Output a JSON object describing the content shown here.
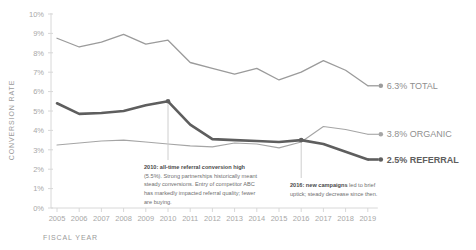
{
  "chart_data": {
    "type": "line",
    "title": "",
    "xlabel": "FISCAL YEAR",
    "ylabel": "CONVERSION RATE",
    "categories": [
      2005,
      2006,
      2007,
      2008,
      2009,
      2010,
      2011,
      2012,
      2013,
      2014,
      2015,
      2016,
      2017,
      2018,
      2019
    ],
    "ylim": [
      0,
      10
    ],
    "ytick_labels": [
      "0%",
      "1%",
      "2%",
      "3%",
      "4%",
      "5%",
      "6%",
      "7%",
      "8%",
      "9%",
      "10%"
    ],
    "ytick_values": [
      0,
      1,
      2,
      3,
      4,
      5,
      6,
      7,
      8,
      9,
      10
    ],
    "grid": false,
    "legend_position": "end-of-line",
    "series": [
      {
        "name": "TOTAL",
        "color": "#9b9b9b",
        "width": 1.3,
        "end_label": "6.3% TOTAL",
        "end_value": 6.3,
        "values": [
          8.75,
          8.3,
          8.55,
          8.95,
          8.45,
          8.65,
          7.5,
          7.2,
          6.9,
          7.2,
          6.6,
          7.0,
          7.6,
          7.1,
          6.3
        ]
      },
      {
        "name": "ORGANIC",
        "color": "#a5a5a5",
        "width": 1.1,
        "end_label": "3.8% ORGANIC",
        "end_value": 3.8,
        "values": [
          3.25,
          3.35,
          3.45,
          3.5,
          3.4,
          3.3,
          3.2,
          3.15,
          3.35,
          3.3,
          3.1,
          3.4,
          4.2,
          4.05,
          3.8
        ]
      },
      {
        "name": "REFERRAL",
        "color": "#5e5e5e",
        "width": 2.6,
        "end_label": "2.5% REFERRAL",
        "end_value": 2.5,
        "values": [
          5.4,
          4.85,
          4.9,
          5.0,
          5.3,
          5.5,
          4.3,
          3.55,
          3.5,
          3.45,
          3.4,
          3.5,
          3.3,
          2.9,
          2.5
        ]
      }
    ],
    "markers": [
      {
        "series": "REFERRAL",
        "year": 2010,
        "value": 5.5,
        "label": "2010 peak marker"
      },
      {
        "series": "REFERRAL",
        "year": 2016,
        "value": 3.5,
        "label": "2016 uptick marker"
      }
    ],
    "annotations": [
      {
        "id": "annotation-2010",
        "year": 2010,
        "lead": "2010:",
        "text": "2010: all-time referral conversion high (5.5%). Strong partnerships historically meant steady conversions. Entry of competitor ABC has markedly impacted referral quality; fewer are buying.",
        "bold_prefix": "2010: all-time referral conversion high",
        "rest": "(5.5%). Strong partnerships historically meant steady conversions. Entry of competitor ABC has markedly impacted referral quality; fewer are buying."
      },
      {
        "id": "annotation-2016",
        "year": 2016,
        "lead": "2016:",
        "text": "2016: new campaigns led to brief uptick; steady decrease since then.",
        "bold_prefix": "2016: new campaigns",
        "rest": "led to brief uptick; steady decrease since then."
      }
    ]
  },
  "colors": {
    "total": "#9b9b9b",
    "organic": "#a5a5a5",
    "referral": "#5e5e5e",
    "axis": "#d8d8d8",
    "tick_text": "#a8a8a8",
    "annotation_text": "#6f6f6f",
    "background": "#ffffff"
  }
}
